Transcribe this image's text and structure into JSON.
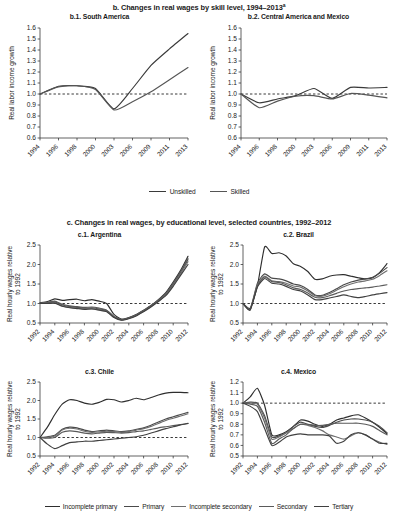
{
  "figure": {
    "section_b": {
      "title": "b. Changes in real wages by skill level, 1994–2013",
      "title_footnote_marker": "a",
      "ylabel": "Real labor income growth",
      "legend": [
        {
          "label": "Unskilled",
          "color": "#3a3a3a"
        },
        {
          "label": "Skilled",
          "color": "#555555"
        }
      ]
    },
    "section_c": {
      "title": "c. Changes in real wages, by educational level, selected countries, 1992–2012",
      "ylabel": "Real hourly wages relative\nto 1992",
      "ylabel_line1": "Real hourly wages relative",
      "ylabel_line2": "to 1992",
      "legend": [
        {
          "label": "Incomplete primary",
          "color": "#2e2e2e"
        },
        {
          "label": "Primary",
          "color": "#4a4a4a"
        },
        {
          "label": "Incomplete secondary",
          "color": "#6e6e6e"
        },
        {
          "label": "Secondary",
          "color": "#5a5a5a"
        },
        {
          "label": "Tertiary",
          "color": "#404040"
        }
      ]
    }
  },
  "chart_data": [
    {
      "id": "b1",
      "type": "line",
      "title": "b.1. South America",
      "xlabel": "",
      "ylabel": "Real labor income growth",
      "ylim": [
        0.6,
        1.6
      ],
      "yticks": [
        0.6,
        0.7,
        0.8,
        0.9,
        1.0,
        1.1,
        1.2,
        1.3,
        1.4,
        1.5,
        1.6
      ],
      "ytick_labels": [
        "0.6",
        "0.7",
        "0.8",
        "0.9",
        "1.0",
        "1.1",
        "1.2",
        "1.3",
        "1.4",
        "1.5",
        "1.6"
      ],
      "x": [
        1994,
        1996,
        1998,
        2000,
        2003,
        2006,
        2009,
        2011,
        2013
      ],
      "xtick_labels": [
        "1994",
        "1996",
        "1998",
        "2000",
        "2003",
        "2006",
        "2009",
        "2011",
        "2013"
      ],
      "grid": false,
      "reference_line": 1.0,
      "legend_position": "below-figure",
      "series": [
        {
          "name": "Unskilled",
          "color": "#3a3a3a",
          "values": [
            1.0,
            1.07,
            1.075,
            1.05,
            0.865,
            1.05,
            1.26,
            1.41,
            1.55
          ]
        },
        {
          "name": "Skilled",
          "color": "#555555",
          "values": [
            1.0,
            1.065,
            1.075,
            1.04,
            0.855,
            0.93,
            1.02,
            1.13,
            1.24
          ]
        }
      ]
    },
    {
      "id": "b2",
      "type": "line",
      "title": "b.2. Central America and Mexico",
      "xlabel": "",
      "ylabel": "Real labor income growth",
      "ylim": [
        0.6,
        1.6
      ],
      "yticks": [
        0.6,
        0.7,
        0.8,
        0.9,
        1.0,
        1.1,
        1.2,
        1.3,
        1.4,
        1.5,
        1.6
      ],
      "ytick_labels": [
        "0.6",
        "0.7",
        "0.8",
        "0.9",
        "1.0",
        "1.1",
        "1.2",
        "1.3",
        "1.4",
        "1.5",
        "1.6"
      ],
      "x": [
        1994,
        1996,
        1998,
        2000,
        2003,
        2006,
        2009,
        2011,
        2013
      ],
      "xtick_labels": [
        "1994",
        "1996",
        "1998",
        "2000",
        "2003",
        "2006",
        "2009",
        "2011",
        "2013"
      ],
      "grid": false,
      "reference_line": 1.0,
      "legend_position": "below-figure",
      "series": [
        {
          "name": "Unskilled",
          "color": "#3a3a3a",
          "values": [
            1.0,
            0.92,
            0.955,
            0.985,
            1.05,
            0.96,
            1.06,
            1.055,
            1.06
          ]
        },
        {
          "name": "Skilled",
          "color": "#555555",
          "values": [
            1.0,
            0.875,
            0.935,
            0.98,
            0.985,
            0.955,
            1.005,
            0.99,
            0.965
          ]
        }
      ]
    },
    {
      "id": "c1",
      "type": "line",
      "title": "c.1. Argentina",
      "xlabel": "",
      "ylabel": "Real hourly wages relative to 1992",
      "ylim": [
        0.5,
        2.5
      ],
      "yticks": [
        0.5,
        1.0,
        1.5,
        2.0,
        2.5
      ],
      "ytick_labels": [
        "0.5",
        "1.0",
        "1.5",
        "2.0",
        "2.5"
      ],
      "x": [
        1992,
        1993,
        1994,
        1995,
        1996,
        1997,
        1998,
        1999,
        2000,
        2001,
        2002,
        2003,
        2004,
        2005,
        2006,
        2007,
        2008,
        2009,
        2010,
        2011,
        2012
      ],
      "xtick_labels": [
        "1992",
        "1994",
        "1996",
        "1998",
        "2000",
        "2002",
        "2004",
        "2006",
        "2008",
        "2010",
        "2012"
      ],
      "grid": false,
      "reference_line": 1.0,
      "legend_position": "below-figure",
      "series": [
        {
          "name": "Incomplete primary",
          "color": "#2e2e2e",
          "values": [
            1.02,
            1.05,
            1.12,
            1.08,
            1.1,
            1.11,
            1.07,
            1.1,
            1.06,
            1.0,
            0.72,
            0.6,
            0.64,
            0.72,
            0.83,
            0.95,
            1.1,
            1.28,
            1.55,
            1.85,
            2.21
          ]
        },
        {
          "name": "Primary",
          "color": "#4a4a4a",
          "values": [
            1.0,
            1.02,
            1.04,
            0.96,
            0.92,
            0.9,
            0.88,
            0.89,
            0.86,
            0.82,
            0.66,
            0.58,
            0.62,
            0.7,
            0.81,
            0.93,
            1.08,
            1.25,
            1.5,
            1.8,
            2.12
          ]
        },
        {
          "name": "Incomplete secondary",
          "color": "#6e6e6e",
          "values": [
            1.0,
            1.01,
            1.02,
            0.94,
            0.9,
            0.88,
            0.86,
            0.87,
            0.84,
            0.8,
            0.65,
            0.58,
            0.62,
            0.69,
            0.8,
            0.92,
            1.06,
            1.22,
            1.47,
            1.76,
            2.07
          ]
        },
        {
          "name": "Secondary",
          "color": "#5a5a5a",
          "values": [
            1.01,
            1.03,
            1.06,
            0.98,
            0.94,
            0.92,
            0.9,
            0.91,
            0.88,
            0.83,
            0.67,
            0.59,
            0.63,
            0.71,
            0.82,
            0.94,
            1.09,
            1.26,
            1.52,
            1.82,
            2.16
          ]
        },
        {
          "name": "Tertiary",
          "color": "#404040",
          "values": [
            1.0,
            1.0,
            1.01,
            0.93,
            0.89,
            0.87,
            0.85,
            0.86,
            0.83,
            0.79,
            0.64,
            0.57,
            0.61,
            0.68,
            0.79,
            0.91,
            1.05,
            1.2,
            1.44,
            1.72,
            2.0
          ]
        }
      ]
    },
    {
      "id": "c2",
      "type": "line",
      "title": "c.2. Brazil",
      "xlabel": "",
      "ylabel": "Real hourly wages relative to 1992",
      "ylim": [
        0.5,
        2.5
      ],
      "yticks": [
        0.5,
        1.0,
        1.5,
        2.0,
        2.5
      ],
      "ytick_labels": [
        "0.5",
        "1.0",
        "1.5",
        "2.0",
        "2.5"
      ],
      "x": [
        1992,
        1993,
        1994,
        1995,
        1996,
        1997,
        1998,
        1999,
        2000,
        2001,
        2002,
        2003,
        2004,
        2005,
        2006,
        2007,
        2008,
        2009,
        2010,
        2011,
        2012
      ],
      "xtick_labels": [
        "1992",
        "1994",
        "1996",
        "1998",
        "2000",
        "2002",
        "2004",
        "2006",
        "2008",
        "2010",
        "2012"
      ],
      "grid": false,
      "reference_line": 1.0,
      "legend_position": "below-figure",
      "series": [
        {
          "name": "Incomplete primary",
          "color": "#2e2e2e",
          "values": [
            1.0,
            0.88,
            1.45,
            2.45,
            2.28,
            2.3,
            2.22,
            2.02,
            1.95,
            1.82,
            1.62,
            1.63,
            1.7,
            1.73,
            1.74,
            1.7,
            1.66,
            1.63,
            1.66,
            1.8,
            2.02
          ]
        },
        {
          "name": "Primary",
          "color": "#4a4a4a",
          "values": [
            1.0,
            0.86,
            1.52,
            1.76,
            1.65,
            1.63,
            1.58,
            1.5,
            1.46,
            1.36,
            1.22,
            1.21,
            1.28,
            1.38,
            1.48,
            1.55,
            1.6,
            1.63,
            1.67,
            1.78,
            1.92
          ]
        },
        {
          "name": "Incomplete secondary",
          "color": "#6e6e6e",
          "values": [
            1.0,
            0.85,
            1.48,
            1.7,
            1.58,
            1.56,
            1.52,
            1.45,
            1.42,
            1.32,
            1.2,
            1.19,
            1.25,
            1.34,
            1.43,
            1.5,
            1.55,
            1.58,
            1.62,
            1.72,
            1.84
          ]
        },
        {
          "name": "Secondary",
          "color": "#5a5a5a",
          "values": [
            1.0,
            0.84,
            1.45,
            1.68,
            1.56,
            1.54,
            1.48,
            1.4,
            1.36,
            1.27,
            1.16,
            1.15,
            1.2,
            1.26,
            1.32,
            1.36,
            1.38,
            1.4,
            1.42,
            1.45,
            1.48
          ]
        },
        {
          "name": "Tertiary",
          "color": "#404040",
          "values": [
            1.0,
            0.83,
            1.42,
            1.64,
            1.52,
            1.5,
            1.44,
            1.36,
            1.32,
            1.22,
            1.1,
            1.1,
            1.14,
            1.18,
            1.22,
            1.18,
            1.15,
            1.18,
            1.22,
            1.25,
            1.28
          ]
        }
      ]
    },
    {
      "id": "c3",
      "type": "line",
      "title": "c.3. Chile",
      "xlabel": "",
      "ylabel": "Real hourly wages relative to 1992",
      "ylim": [
        0.5,
        2.5
      ],
      "yticks": [
        0.5,
        1.0,
        1.5,
        2.0,
        2.5
      ],
      "ytick_labels": [
        "0.5",
        "1.0",
        "1.5",
        "2.0",
        "2.5"
      ],
      "x": [
        1992,
        1993,
        1994,
        1995,
        1996,
        1997,
        1998,
        1999,
        2000,
        2001,
        2002,
        2003,
        2004,
        2005,
        2006,
        2007,
        2008,
        2009,
        2010,
        2011,
        2012
      ],
      "xtick_labels": [
        "1992",
        "1994",
        "1996",
        "1998",
        "2000",
        "2002",
        "2004",
        "2006",
        "2008",
        "2010",
        "2012"
      ],
      "grid": false,
      "reference_line": 1.0,
      "legend_position": "below-figure",
      "series": [
        {
          "name": "Incomplete primary",
          "color": "#2e2e2e",
          "values": [
            1.0,
            1.28,
            1.62,
            1.9,
            2.02,
            2.0,
            1.93,
            1.9,
            1.95,
            2.03,
            2.02,
            1.96,
            2.0,
            2.06,
            2.02,
            2.08,
            2.15,
            2.2,
            2.22,
            2.22,
            2.21
          ]
        },
        {
          "name": "Primary",
          "color": "#4a4a4a",
          "values": [
            1.0,
            1.02,
            1.06,
            1.22,
            1.28,
            1.26,
            1.2,
            1.16,
            1.18,
            1.2,
            1.18,
            1.16,
            1.18,
            1.22,
            1.26,
            1.33,
            1.42,
            1.5,
            1.56,
            1.62,
            1.68
          ]
        },
        {
          "name": "Incomplete secondary",
          "color": "#6e6e6e",
          "values": [
            1.0,
            1.0,
            1.04,
            1.2,
            1.25,
            1.23,
            1.17,
            1.14,
            1.15,
            1.17,
            1.16,
            1.14,
            1.16,
            1.2,
            1.24,
            1.3,
            1.38,
            1.46,
            1.52,
            1.58,
            1.64
          ]
        },
        {
          "name": "Secondary",
          "color": "#5a5a5a",
          "values": [
            1.0,
            0.98,
            1.0,
            1.14,
            1.18,
            1.16,
            1.12,
            1.1,
            1.12,
            1.14,
            1.13,
            1.12,
            1.13,
            1.16,
            1.18,
            1.22,
            1.26,
            1.29,
            1.32,
            1.35,
            1.38
          ]
        },
        {
          "name": "Tertiary",
          "color": "#404040",
          "values": [
            1.0,
            0.82,
            0.7,
            0.78,
            0.86,
            0.88,
            0.9,
            0.9,
            0.92,
            0.94,
            0.96,
            0.98,
            1.0,
            1.02,
            1.06,
            1.12,
            1.18,
            1.24,
            1.29,
            1.34,
            1.38
          ]
        }
      ]
    },
    {
      "id": "c4",
      "type": "line",
      "title": "c.4. Mexico",
      "xlabel": "",
      "ylabel": "Real hourly wages relative to 1992",
      "ylim": [
        0.5,
        1.2
      ],
      "yticks": [
        0.5,
        0.6,
        0.7,
        0.8,
        0.9,
        1.0,
        1.1,
        1.2
      ],
      "ytick_labels": [
        "0.5",
        "0.6",
        "0.7",
        "0.8",
        "0.9",
        "1.0",
        "1.1",
        "1.2"
      ],
      "x": [
        1992,
        1993,
        1994,
        1995,
        1996,
        1997,
        1998,
        1999,
        2000,
        2001,
        2002,
        2003,
        2004,
        2005,
        2006,
        2007,
        2008,
        2009,
        2010,
        2011,
        2012
      ],
      "xtick_labels": [
        "1992",
        "1994",
        "1996",
        "1998",
        "2000",
        "2002",
        "2004",
        "2006",
        "2008",
        "2010",
        "2012"
      ],
      "grid": false,
      "reference_line": 1.0,
      "legend_position": "below-figure",
      "series": [
        {
          "name": "Incomplete primary",
          "color": "#2e2e2e",
          "values": [
            1.0,
            1.06,
            1.14,
            0.98,
            0.7,
            0.7,
            0.73,
            0.78,
            0.84,
            0.83,
            0.8,
            0.78,
            0.8,
            0.84,
            0.86,
            0.88,
            0.89,
            0.86,
            0.82,
            0.77,
            0.71
          ]
        },
        {
          "name": "Primary",
          "color": "#4a4a4a",
          "values": [
            1.0,
            1.01,
            1.0,
            0.88,
            0.68,
            0.69,
            0.72,
            0.78,
            0.82,
            0.8,
            0.78,
            0.77,
            0.79,
            0.82,
            0.84,
            0.85,
            0.85,
            0.84,
            0.82,
            0.78,
            0.72
          ]
        },
        {
          "name": "Incomplete secondary",
          "color": "#6e6e6e",
          "values": [
            1.0,
            1.0,
            0.99,
            0.86,
            0.66,
            0.68,
            0.72,
            0.76,
            0.8,
            0.79,
            0.77,
            0.74,
            0.7,
            0.68,
            0.66,
            0.69,
            0.72,
            0.7,
            0.66,
            0.63,
            0.61
          ]
        },
        {
          "name": "Secondary",
          "color": "#5a5a5a",
          "values": [
            1.0,
            0.99,
            0.97,
            0.82,
            0.62,
            0.66,
            0.7,
            0.76,
            0.8,
            0.8,
            0.79,
            0.79,
            0.8,
            0.81,
            0.81,
            0.81,
            0.81,
            0.8,
            0.78,
            0.74,
            0.7
          ]
        },
        {
          "name": "Tertiary",
          "color": "#404040",
          "values": [
            1.0,
            0.97,
            0.92,
            0.76,
            0.6,
            0.63,
            0.68,
            0.7,
            0.71,
            0.7,
            0.7,
            0.7,
            0.69,
            0.62,
            0.64,
            0.7,
            0.72,
            0.7,
            0.66,
            0.62,
            0.62
          ]
        }
      ]
    }
  ]
}
